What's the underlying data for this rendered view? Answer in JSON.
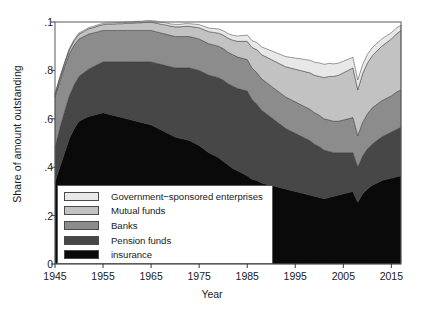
{
  "chart_data": {
    "type": "area",
    "stacked": true,
    "title": "",
    "xlabel": "Year",
    "ylabel": "Share of amount outstanding",
    "xlim": [
      1945,
      2017
    ],
    "ylim": [
      0,
      1
    ],
    "xticks": [
      1945,
      1955,
      1965,
      1975,
      1985,
      1995,
      2005,
      2015
    ],
    "xtick_labels": [
      "1945",
      "1955",
      "1965",
      "1975",
      "1985",
      "1995",
      "2005",
      "2015"
    ],
    "yticks": [
      0,
      0.2,
      0.4,
      0.6,
      0.8,
      1
    ],
    "ytick_labels": [
      "0",
      ".2",
      ".4",
      ".6",
      ".8",
      ".1"
    ],
    "grid": false,
    "legend_position": "lower-left",
    "stack_order_bottom_to_top": [
      "Insurance",
      "Pension funds",
      "Banks",
      "Mutual funds",
      "Government-sponsored enterprises"
    ],
    "x": [
      1945,
      1946,
      1947,
      1948,
      1949,
      1950,
      1951,
      1952,
      1953,
      1954,
      1955,
      1956,
      1957,
      1958,
      1959,
      1960,
      1961,
      1962,
      1963,
      1964,
      1965,
      1966,
      1967,
      1968,
      1969,
      1970,
      1971,
      1972,
      1973,
      1974,
      1975,
      1976,
      1977,
      1978,
      1979,
      1980,
      1981,
      1982,
      1983,
      1984,
      1985,
      1986,
      1987,
      1988,
      1989,
      1990,
      1991,
      1992,
      1993,
      1994,
      1995,
      1996,
      1997,
      1998,
      1999,
      2000,
      2001,
      2002,
      2003,
      2004,
      2005,
      2006,
      2007,
      2008,
      2009,
      2010,
      2011,
      2012,
      2013,
      2014,
      2015,
      2016,
      2017
    ],
    "series": [
      {
        "name": "Insurance",
        "color": "#0a0a0a",
        "values": [
          0.34,
          0.4,
          0.46,
          0.52,
          0.56,
          0.59,
          0.6,
          0.61,
          0.615,
          0.62,
          0.625,
          0.62,
          0.615,
          0.61,
          0.605,
          0.6,
          0.595,
          0.59,
          0.585,
          0.58,
          0.575,
          0.565,
          0.555,
          0.545,
          0.535,
          0.525,
          0.52,
          0.515,
          0.51,
          0.5,
          0.49,
          0.475,
          0.46,
          0.45,
          0.44,
          0.425,
          0.41,
          0.395,
          0.385,
          0.375,
          0.365,
          0.35,
          0.345,
          0.335,
          0.33,
          0.325,
          0.32,
          0.315,
          0.31,
          0.305,
          0.3,
          0.295,
          0.29,
          0.285,
          0.28,
          0.275,
          0.27,
          0.275,
          0.28,
          0.285,
          0.29,
          0.295,
          0.3,
          0.255,
          0.29,
          0.31,
          0.325,
          0.335,
          0.345,
          0.35,
          0.355,
          0.36,
          0.365
        ]
      },
      {
        "name": "Pension funds",
        "color": "#474747",
        "values": [
          0.14,
          0.16,
          0.17,
          0.175,
          0.18,
          0.185,
          0.19,
          0.195,
          0.2,
          0.205,
          0.21,
          0.215,
          0.22,
          0.225,
          0.23,
          0.235,
          0.24,
          0.245,
          0.25,
          0.255,
          0.26,
          0.265,
          0.27,
          0.275,
          0.28,
          0.285,
          0.29,
          0.295,
          0.3,
          0.305,
          0.31,
          0.315,
          0.32,
          0.325,
          0.33,
          0.335,
          0.335,
          0.34,
          0.34,
          0.345,
          0.35,
          0.33,
          0.315,
          0.3,
          0.29,
          0.28,
          0.27,
          0.26,
          0.25,
          0.245,
          0.24,
          0.235,
          0.23,
          0.225,
          0.215,
          0.21,
          0.2,
          0.19,
          0.18,
          0.175,
          0.17,
          0.165,
          0.16,
          0.145,
          0.155,
          0.165,
          0.17,
          0.175,
          0.18,
          0.185,
          0.19,
          0.195,
          0.2
        ]
      },
      {
        "name": "Banks",
        "color": "#8c8c8c",
        "values": [
          0.21,
          0.195,
          0.185,
          0.175,
          0.165,
          0.155,
          0.15,
          0.145,
          0.14,
          0.135,
          0.13,
          0.13,
          0.13,
          0.13,
          0.13,
          0.13,
          0.13,
          0.13,
          0.13,
          0.13,
          0.13,
          0.13,
          0.13,
          0.13,
          0.13,
          0.13,
          0.13,
          0.13,
          0.13,
          0.13,
          0.13,
          0.13,
          0.13,
          0.13,
          0.13,
          0.13,
          0.13,
          0.13,
          0.13,
          0.13,
          0.13,
          0.13,
          0.13,
          0.13,
          0.13,
          0.13,
          0.13,
          0.13,
          0.13,
          0.13,
          0.13,
          0.13,
          0.13,
          0.13,
          0.13,
          0.13,
          0.13,
          0.13,
          0.13,
          0.13,
          0.135,
          0.14,
          0.145,
          0.13,
          0.14,
          0.145,
          0.15,
          0.15,
          0.15,
          0.15,
          0.15,
          0.155,
          0.155
        ]
      },
      {
        "name": "Mutual funds",
        "color": "#c2c2c2",
        "values": [
          0.01,
          0.012,
          0.014,
          0.016,
          0.018,
          0.02,
          0.02,
          0.022,
          0.022,
          0.024,
          0.024,
          0.026,
          0.026,
          0.028,
          0.028,
          0.03,
          0.03,
          0.032,
          0.032,
          0.034,
          0.034,
          0.036,
          0.036,
          0.038,
          0.038,
          0.04,
          0.04,
          0.042,
          0.042,
          0.044,
          0.046,
          0.048,
          0.05,
          0.052,
          0.054,
          0.056,
          0.058,
          0.06,
          0.065,
          0.07,
          0.075,
          0.085,
          0.095,
          0.1,
          0.105,
          0.11,
          0.115,
          0.12,
          0.125,
          0.13,
          0.135,
          0.14,
          0.145,
          0.15,
          0.155,
          0.16,
          0.17,
          0.18,
          0.185,
          0.19,
          0.195,
          0.2,
          0.205,
          0.19,
          0.2,
          0.21,
          0.215,
          0.22,
          0.225,
          0.23,
          0.235,
          0.24,
          0.245
        ]
      },
      {
        "name": "Government-sponsored enterprises",
        "color": "#e8e8e8",
        "values": [
          0.005,
          0.005,
          0.005,
          0.005,
          0.005,
          0.005,
          0.005,
          0.005,
          0.005,
          0.005,
          0.005,
          0.005,
          0.005,
          0.005,
          0.005,
          0.005,
          0.006,
          0.006,
          0.006,
          0.007,
          0.007,
          0.008,
          0.008,
          0.009,
          0.009,
          0.01,
          0.01,
          0.011,
          0.011,
          0.012,
          0.013,
          0.014,
          0.015,
          0.016,
          0.017,
          0.018,
          0.019,
          0.02,
          0.022,
          0.024,
          0.026,
          0.028,
          0.03,
          0.032,
          0.034,
          0.036,
          0.038,
          0.04,
          0.042,
          0.044,
          0.046,
          0.048,
          0.05,
          0.052,
          0.054,
          0.056,
          0.055,
          0.054,
          0.052,
          0.05,
          0.048,
          0.046,
          0.044,
          0.04,
          0.038,
          0.036,
          0.034,
          0.032,
          0.03,
          0.028,
          0.026,
          0.024,
          0.022
        ]
      }
    ]
  },
  "axes": {
    "ylabel": "Share of amount outstanding",
    "xlabel": "Year"
  },
  "legend": {
    "items": [
      {
        "label": "Government−sponsored enterprises",
        "color": "#e8e8e8"
      },
      {
        "label": "Mutual funds",
        "color": "#c2c2c2"
      },
      {
        "label": "Banks",
        "color": "#8c8c8c"
      },
      {
        "label": "Pension funds",
        "color": "#474747"
      },
      {
        "label": "insurance",
        "color": "#0a0a0a"
      }
    ]
  }
}
